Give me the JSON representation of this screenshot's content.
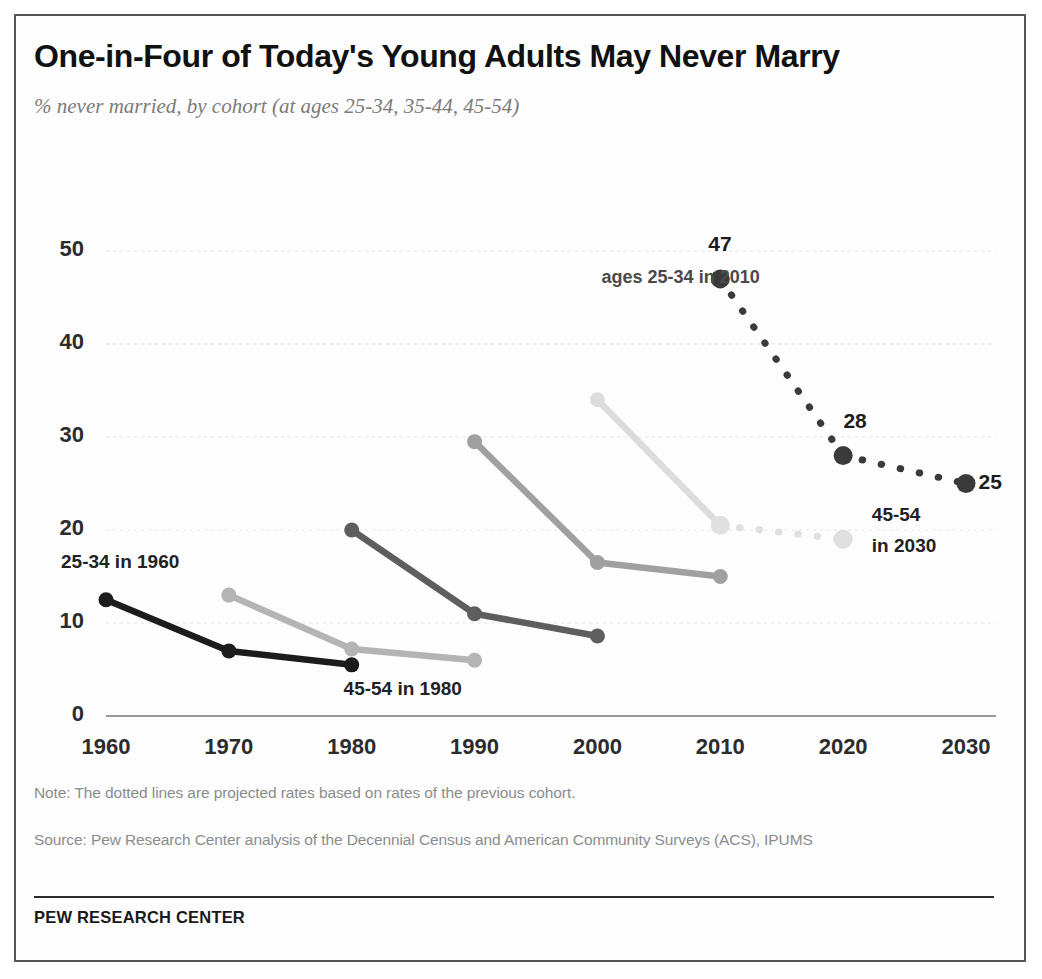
{
  "header": {
    "title": "One-in-Four  of Today's Young Adults May Never Marry",
    "subtitle": "% never married, by cohort (at ages 25-34, 35-44, 45-54)"
  },
  "footer": {
    "note": "Note: The dotted lines are projected rates based on rates of the previous cohort.",
    "source": "Source: Pew Research Center analysis of the Decennial Census and American Community Surveys (ACS), IPUMS",
    "brand": "PEW RESEARCH CENTER"
  },
  "chart_data": {
    "type": "line",
    "title": "One-in-Four  of Today's Young Adults May Never Marry",
    "subtitle": "% never married, by cohort (at ages 25-34, 35-44, 45-54)",
    "xlabel": "",
    "ylabel": "",
    "xlim": [
      1960,
      2030
    ],
    "ylim": [
      0,
      52
    ],
    "grid": true,
    "legend_position": "inline-annotations",
    "xticks": [
      "1960",
      "1970",
      "1980",
      "1990",
      "2000",
      "2010",
      "2020",
      "2030"
    ],
    "yticks": [
      "0",
      "10",
      "20",
      "30",
      "40",
      "50"
    ],
    "series": [
      {
        "name": "cohort 25-34 in 1960",
        "color": "#1c1c1c",
        "style": "solid",
        "x": [
          1960,
          1970,
          1980
        ],
        "values": [
          12.5,
          7,
          5.5
        ]
      },
      {
        "name": "cohort 25-34 in 1970",
        "color": "#b4b4b4",
        "style": "solid",
        "x": [
          1970,
          1980,
          1990
        ],
        "values": [
          13,
          7.2,
          6
        ]
      },
      {
        "name": "cohort 25-34 in 1980",
        "color": "#5e5e5e",
        "style": "solid",
        "x": [
          1980,
          1990,
          2000
        ],
        "values": [
          20,
          11,
          8.6
        ]
      },
      {
        "name": "cohort 25-34 in 1990",
        "color": "#a0a0a0",
        "style": "solid",
        "x": [
          1990,
          2000,
          2010
        ],
        "values": [
          29.5,
          16.5,
          15
        ]
      },
      {
        "name": "cohort 25-34 in 2000",
        "color": "#dcdcdc",
        "style": "solid",
        "x": [
          2000,
          2010
        ],
        "values": [
          34,
          20.5
        ]
      },
      {
        "name": "cohort 25-34 in 2000 (projected)",
        "color": "#e0e0e0",
        "style": "dotted",
        "x": [
          2010,
          2020
        ],
        "values": [
          20.5,
          19
        ]
      },
      {
        "name": "cohort 25-34 in 2010 (projected)",
        "color": "#3a3a3a",
        "style": "dotted",
        "x": [
          2010,
          2020,
          2030
        ],
        "values": [
          47,
          28,
          25
        ]
      }
    ],
    "annotations": [
      {
        "text": "25-34 in 1960",
        "x": 1960,
        "y": 16.5
      },
      {
        "text": "45-54 in 1980",
        "x": 1983,
        "y": 2.8
      },
      {
        "text": "ages 25-34 in 2010",
        "x": 2004,
        "y": 47
      },
      {
        "text": "45-54",
        "x": 2026,
        "y": 21.5
      },
      {
        "text": "in 2030",
        "x": 2026,
        "y": 18.2
      }
    ],
    "data_labels": [
      {
        "text": "47",
        "x": 2010,
        "y": 50.5
      },
      {
        "text": "28",
        "x": 2021,
        "y": 31.5
      },
      {
        "text": "25",
        "x": 2032,
        "y": 25
      }
    ]
  }
}
